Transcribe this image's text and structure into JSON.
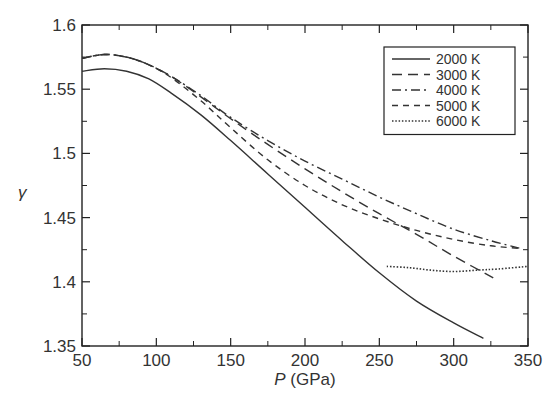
{
  "chart_data": {
    "type": "line",
    "title": "",
    "xlabel": "P (GPa)",
    "xlabel_italic": "P",
    "xlabel_unit": " (GPa)",
    "ylabel": "γ",
    "xlim": [
      50,
      350
    ],
    "ylim": [
      1.35,
      1.6
    ],
    "xticks": [
      50,
      100,
      150,
      200,
      250,
      300,
      350
    ],
    "xtick_labels": [
      "50",
      "100",
      "150",
      "200",
      "250",
      "300",
      "350"
    ],
    "yticks": [
      1.35,
      1.4,
      1.45,
      1.5,
      1.55,
      1.6
    ],
    "ytick_labels": [
      "1.35",
      "1.4",
      "1.45",
      "1.5",
      "1.55",
      "1.6"
    ],
    "grid": false,
    "legend_position": "upper right",
    "series": [
      {
        "name": "2000 K",
        "style": "solid",
        "x": [
          50,
          65,
          80,
          95,
          110,
          130,
          150,
          175,
          200,
          225,
          250,
          275,
          300,
          320
        ],
        "values": [
          1.564,
          1.566,
          1.564,
          1.558,
          1.547,
          1.53,
          1.51,
          1.484,
          1.458,
          1.432,
          1.407,
          1.385,
          1.368,
          1.356
        ]
      },
      {
        "name": "3000 K",
        "style": "long-dash",
        "x": [
          50,
          65,
          80,
          95,
          110,
          130,
          150,
          175,
          200,
          225,
          250,
          275,
          300,
          330
        ],
        "values": [
          1.574,
          1.577,
          1.575,
          1.569,
          1.56,
          1.544,
          1.527,
          1.507,
          1.488,
          1.47,
          1.453,
          1.437,
          1.42,
          1.401
        ]
      },
      {
        "name": "4000 K",
        "style": "dash-dot",
        "x": [
          50,
          65,
          80,
          95,
          110,
          130,
          150,
          175,
          200,
          225,
          250,
          275,
          300,
          325,
          345
        ],
        "values": [
          1.574,
          1.577,
          1.575,
          1.569,
          1.56,
          1.545,
          1.528,
          1.51,
          1.494,
          1.48,
          1.466,
          1.453,
          1.441,
          1.432,
          1.426
        ]
      },
      {
        "name": "5000 K",
        "style": "dashed",
        "x": [
          50,
          65,
          80,
          95,
          110,
          130,
          150,
          175,
          200,
          225,
          250,
          275,
          300,
          325,
          345
        ],
        "values": [
          1.574,
          1.577,
          1.575,
          1.569,
          1.559,
          1.541,
          1.52,
          1.495,
          1.475,
          1.46,
          1.449,
          1.44,
          1.433,
          1.428,
          1.426
        ]
      },
      {
        "name": "6000 K",
        "style": "dotted",
        "x": [
          255,
          270,
          285,
          300,
          315,
          330,
          350
        ],
        "values": [
          1.412,
          1.411,
          1.409,
          1.408,
          1.409,
          1.41,
          1.412
        ]
      }
    ]
  },
  "legend": {
    "items": [
      {
        "label": "2000 K",
        "style": "solid"
      },
      {
        "label": "3000 K",
        "style": "long-dash"
      },
      {
        "label": "4000 K",
        "style": "dash-dot"
      },
      {
        "label": "5000 K",
        "style": "dashed"
      },
      {
        "label": "6000 K",
        "style": "dotted"
      }
    ]
  },
  "colors": {
    "line": "#333333",
    "axis": "#222222",
    "background": "#ffffff"
  }
}
